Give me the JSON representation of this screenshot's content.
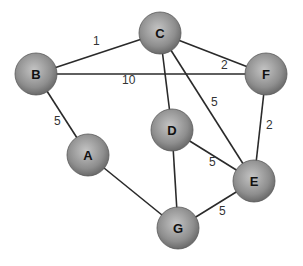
{
  "diagram": {
    "type": "weighted-undirected-graph",
    "nodes": [
      {
        "id": "A",
        "label": "A",
        "x": 88,
        "y": 155
      },
      {
        "id": "B",
        "label": "B",
        "x": 36,
        "y": 74
      },
      {
        "id": "C",
        "label": "C",
        "x": 160,
        "y": 33
      },
      {
        "id": "D",
        "label": "D",
        "x": 172,
        "y": 130
      },
      {
        "id": "E",
        "label": "E",
        "x": 254,
        "y": 181
      },
      {
        "id": "F",
        "label": "F",
        "x": 266,
        "y": 74
      },
      {
        "id": "G",
        "label": "G",
        "x": 178,
        "y": 228
      }
    ],
    "edges": [
      {
        "from": "B",
        "to": "C",
        "weight": "1",
        "lx": 93,
        "ly": 45
      },
      {
        "from": "B",
        "to": "F",
        "weight": "10",
        "lx": 122,
        "ly": 84
      },
      {
        "from": "C",
        "to": "F",
        "weight": "2",
        "lx": 221,
        "ly": 69
      },
      {
        "from": "B",
        "to": "A",
        "weight": "5",
        "lx": 54,
        "ly": 125
      },
      {
        "from": "C",
        "to": "D",
        "weight": "",
        "lx": 0,
        "ly": 0
      },
      {
        "from": "C",
        "to": "E",
        "weight": "5",
        "lx": 211,
        "ly": 106
      },
      {
        "from": "F",
        "to": "E",
        "weight": "2",
        "lx": 266,
        "ly": 129
      },
      {
        "from": "D",
        "to": "E",
        "weight": "5",
        "lx": 209,
        "ly": 166
      },
      {
        "from": "D",
        "to": "G",
        "weight": "",
        "lx": 0,
        "ly": 0
      },
      {
        "from": "A",
        "to": "G",
        "weight": "",
        "lx": 0,
        "ly": 0
      },
      {
        "from": "G",
        "to": "E",
        "weight": "5",
        "lx": 219,
        "ly": 215
      }
    ],
    "node_radius": 21,
    "colors": {
      "node_light": "#c8c8c8",
      "node_dark": "#7a7a7a",
      "edge": "#2a2a2a"
    }
  }
}
